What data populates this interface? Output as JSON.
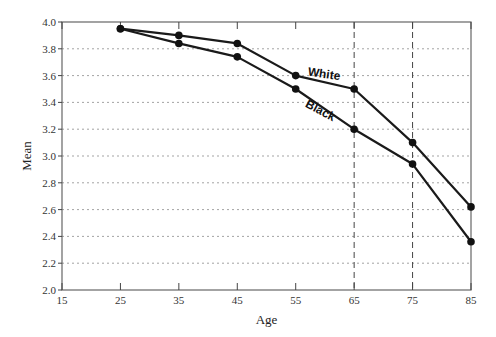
{
  "chart_data": {
    "type": "line",
    "title": "",
    "xlabel": "Age",
    "ylabel": "Mean",
    "xlim": [
      15,
      85
    ],
    "ylim": [
      2.0,
      4.0
    ],
    "x_ticks": [
      15,
      25,
      35,
      45,
      55,
      65,
      75,
      85
    ],
    "x_tick_labels": [
      "15",
      "25",
      "35",
      "45",
      "55",
      "65",
      "75",
      "85"
    ],
    "y_ticks": [
      2.0,
      2.2,
      2.4,
      2.6,
      2.8,
      3.0,
      3.2,
      3.4,
      3.6,
      3.8,
      4.0
    ],
    "y_tick_labels": [
      "2.0",
      "2.2",
      "2.4",
      "2.6",
      "2.8",
      "3.0",
      "3.2",
      "3.4",
      "3.6",
      "3.8",
      "4.0"
    ],
    "grid": "horizontal dotted",
    "reference_lines_x": [
      65,
      75
    ],
    "x": [
      25,
      35,
      45,
      55,
      65,
      75,
      85
    ],
    "series": [
      {
        "name": "White",
        "values": [
          3.95,
          3.9,
          3.84,
          3.6,
          3.5,
          3.1,
          2.62
        ],
        "label_at": [
          57,
          3.6
        ]
      },
      {
        "name": "Black",
        "values": [
          3.95,
          3.84,
          3.74,
          3.5,
          3.2,
          2.94,
          2.36
        ],
        "label_at": [
          56.5,
          3.37
        ]
      }
    ],
    "legend": "inline labels"
  }
}
